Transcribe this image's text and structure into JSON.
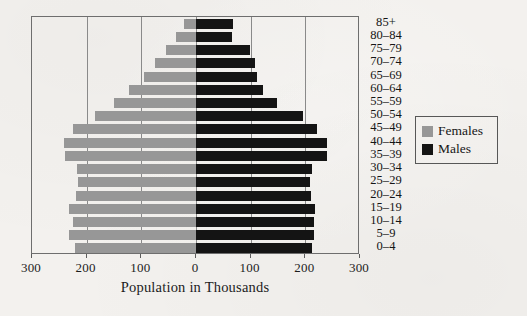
{
  "chart_data": {
    "type": "bar",
    "subtype": "population-pyramid",
    "title": "",
    "xlabel": "Population in Thousands",
    "ylabel": "",
    "xlim": [
      -300,
      300
    ],
    "xticks": [
      300,
      200,
      100,
      0,
      100,
      200,
      300
    ],
    "grid": true,
    "gridlines_at": [
      -200,
      -100,
      0,
      100,
      200
    ],
    "legend_position": "right",
    "categories": [
      "85+",
      "80–84",
      "75–79",
      "70–74",
      "65–69",
      "60–64",
      "55–59",
      "50–54",
      "45–49",
      "40–44",
      "35–39",
      "30–34",
      "25–29",
      "20–24",
      "15–19",
      "10–14",
      "5–9",
      "0–4"
    ],
    "series": [
      {
        "name": "Females",
        "color": "#979797",
        "side": "left",
        "values": [
          22,
          37,
          55,
          75,
          95,
          123,
          150,
          185,
          225,
          242,
          240,
          218,
          215,
          220,
          233,
          225,
          232,
          222
        ]
      },
      {
        "name": "Males",
        "color": "#141414",
        "side": "right",
        "values": [
          68,
          66,
          98,
          108,
          112,
          122,
          148,
          195,
          222,
          239,
          240,
          212,
          208,
          210,
          218,
          215,
          216,
          212
        ]
      }
    ]
  },
  "axis": {
    "tick_labels": [
      "300",
      "200",
      "100",
      "0",
      "100",
      "200",
      "300"
    ],
    "title": "Population in Thousands"
  },
  "age_labels": [
    "85+",
    "80–84",
    "75–79",
    "70–74",
    "65–69",
    "60–64",
    "55–59",
    "50–54",
    "45–49",
    "40–44",
    "35–39",
    "30–34",
    "25–29",
    "20–24",
    "15–19",
    "10–14",
    "5–9",
    "0–4"
  ],
  "legend": {
    "items": [
      {
        "label": "Females",
        "color": "#979797"
      },
      {
        "label": "Males",
        "color": "#141414"
      }
    ]
  },
  "colors": {
    "female": "#979797",
    "male": "#141414",
    "background": "#f3f1ee",
    "frame": "#6e6e6e",
    "gridline": "#8a8a8a",
    "text": "#161616"
  }
}
